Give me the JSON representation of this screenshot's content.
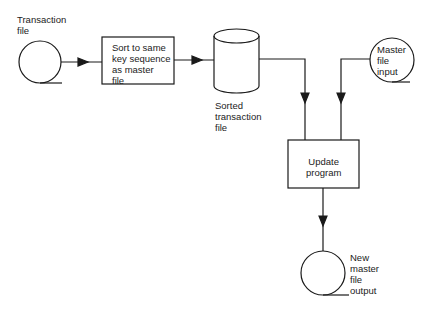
{
  "diagram": {
    "type": "flowchart",
    "nodes": {
      "transaction_file": {
        "label": "Transaction\nfile",
        "shape": "tape-reel"
      },
      "sort": {
        "label": "Sort to same\nkey sequence\nas master\nfile",
        "shape": "process"
      },
      "sorted_file": {
        "label": "Sorted\ntransaction\nfile",
        "shape": "disk-cylinder"
      },
      "master_input": {
        "label": "Master\nfile\ninput",
        "shape": "tape-reel"
      },
      "update": {
        "label": "Update\nprogram",
        "shape": "process"
      },
      "new_master": {
        "label": "New\nmaster\nfile\noutput",
        "shape": "tape-reel"
      }
    },
    "edges": [
      {
        "from": "transaction_file",
        "to": "sort"
      },
      {
        "from": "sort",
        "to": "sorted_file"
      },
      {
        "from": "sorted_file",
        "to": "update"
      },
      {
        "from": "master_input",
        "to": "update"
      },
      {
        "from": "update",
        "to": "new_master"
      }
    ],
    "colors": {
      "stroke": "#1a1a1a",
      "background": "#ffffff"
    }
  }
}
